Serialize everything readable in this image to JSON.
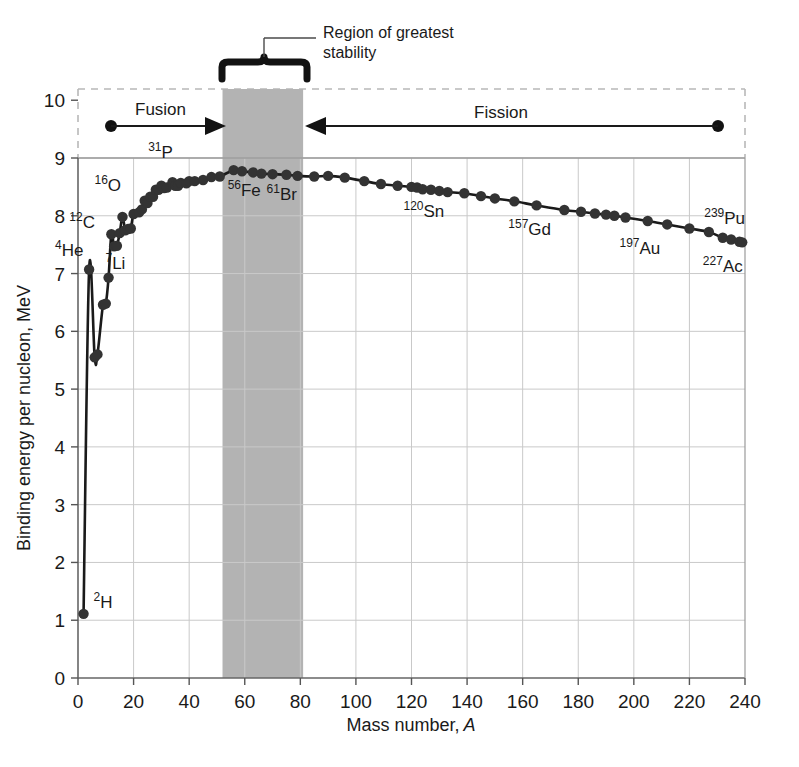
{
  "chart_data": {
    "type": "line",
    "title": "",
    "xlabel": "Mass number, A",
    "ylabel": "Binding energy per nucleon, MeV",
    "xlim": [
      0,
      240
    ],
    "ylim": [
      0,
      10
    ],
    "xticks": [
      0,
      20,
      40,
      60,
      80,
      100,
      120,
      140,
      160,
      180,
      200,
      220,
      240
    ],
    "yticks": [
      0,
      1,
      2,
      3,
      4,
      5,
      6,
      7,
      8,
      9,
      10
    ],
    "grid": true,
    "legend": "none",
    "series": [
      {
        "name": "Binding energy per nucleon",
        "x": [
          2,
          4,
          6,
          7,
          9,
          10,
          11,
          12,
          13,
          14,
          15,
          16,
          17,
          18,
          19,
          20,
          22,
          23,
          24,
          25,
          26,
          27,
          28,
          29,
          30,
          31,
          32,
          34,
          35,
          36,
          37,
          39,
          40,
          42,
          45,
          48,
          51,
          56,
          59,
          63,
          66,
          70,
          75,
          79,
          85,
          90,
          96,
          103,
          109,
          115,
          120,
          122,
          124,
          127,
          130,
          133,
          139,
          145,
          150,
          157,
          165,
          175,
          181,
          186,
          190,
          193,
          197,
          205,
          212,
          220,
          227,
          232,
          235,
          238,
          239
        ],
        "y": [
          1.11,
          7.07,
          5.55,
          5.6,
          6.46,
          6.48,
          6.93,
          7.68,
          7.47,
          7.48,
          7.7,
          7.98,
          7.75,
          7.77,
          7.78,
          8.03,
          8.06,
          8.11,
          8.26,
          8.22,
          8.33,
          8.33,
          8.45,
          8.45,
          8.52,
          8.48,
          8.49,
          8.58,
          8.52,
          8.52,
          8.57,
          8.56,
          8.6,
          8.6,
          8.62,
          8.67,
          8.68,
          8.79,
          8.77,
          8.75,
          8.73,
          8.72,
          8.71,
          8.69,
          8.68,
          8.69,
          8.66,
          8.6,
          8.55,
          8.52,
          8.5,
          8.49,
          8.46,
          8.45,
          8.43,
          8.41,
          8.39,
          8.34,
          8.3,
          8.25,
          8.18,
          8.1,
          8.07,
          8.04,
          8.02,
          8.0,
          7.97,
          7.91,
          7.85,
          7.78,
          7.72,
          7.62,
          7.59,
          7.55,
          7.54
        ]
      }
    ],
    "point_labels": [
      {
        "id": "2H",
        "sup": "2",
        "sym": "H",
        "x": 2,
        "y": 1.11
      },
      {
        "id": "4He",
        "sup": "4",
        "sym": "He",
        "x": 4,
        "y": 7.07
      },
      {
        "id": "7Li",
        "sup": "7",
        "sym": "Li",
        "x": 7,
        "y": 7.35
      },
      {
        "id": "12C",
        "sup": "12",
        "sym": "C",
        "x": 12,
        "y": 7.68
      },
      {
        "id": "16O",
        "sup": "16",
        "sym": "O",
        "x": 16,
        "y": 7.98
      },
      {
        "id": "31P",
        "sup": "31",
        "sym": "P",
        "x": 31,
        "y": 8.48
      },
      {
        "id": "56Fe",
        "sup": "56",
        "sym": "Fe",
        "x": 56,
        "y": 8.79
      },
      {
        "id": "61Br",
        "sup": "61",
        "sym": "Br",
        "x": 70,
        "y": 8.72
      },
      {
        "id": "120Sn",
        "sup": "120",
        "sym": "Sn",
        "x": 120,
        "y": 8.5
      },
      {
        "id": "157Gd",
        "sup": "157",
        "sym": "Gd",
        "x": 157,
        "y": 8.25
      },
      {
        "id": "197Au",
        "sup": "197",
        "sym": "Au",
        "x": 197,
        "y": 7.97
      },
      {
        "id": "227Ac",
        "sup": "227",
        "sym": "Ac",
        "x": 227,
        "y": 7.72
      },
      {
        "id": "239Pu",
        "sup": "239",
        "sym": "Pu",
        "x": 239,
        "y": 7.54
      }
    ],
    "annotations": {
      "fusion": "Fusion",
      "fission": "Fission",
      "region_line1": "Region of greatest",
      "region_line2": "stability"
    },
    "stability_band": {
      "from": 52,
      "to": 81,
      "color": "#b3b3b3"
    }
  },
  "colors": {
    "curve": "#1a1a1a",
    "marker": "#333333",
    "grid": "#c9c9c9",
    "axis": "#555555",
    "band": "#b3b3b3",
    "dashed": "#b8b8b8",
    "background": "#ffffff"
  }
}
